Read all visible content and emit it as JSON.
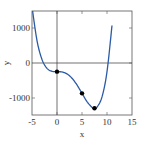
{
  "chart_data": {
    "type": "line",
    "title": "",
    "xlabel": "x",
    "ylabel": "y",
    "xlim": [
      -5,
      15
    ],
    "ylim": [
      -1500,
      1500
    ],
    "xticks": [
      -5,
      0,
      5,
      10,
      15
    ],
    "yticks": [
      -1000,
      0,
      1000
    ],
    "grid": false,
    "zero_lines": true,
    "series": [
      {
        "name": "f(x) = x^4 - 10x^3 - 250",
        "color": "#2b5aa6",
        "x": [
          -5,
          -4,
          -3,
          -2,
          -1,
          0,
          1,
          2,
          3,
          4,
          5,
          6,
          7,
          7.5,
          8,
          9,
          10,
          11
        ],
        "values": [
          1625,
          646,
          101,
          -154,
          -239,
          -250,
          -259,
          -314,
          -439,
          -634,
          -875,
          -1114,
          -1279,
          -1305,
          -1274,
          -979,
          -250,
          1081
        ]
      }
    ],
    "points": [
      {
        "x": 0,
        "y": -250
      },
      {
        "x": 5,
        "y": -875
      },
      {
        "x": 7.5,
        "y": -1305
      }
    ],
    "point_color": "#000000"
  },
  "labels": {
    "xlabel": "x",
    "ylabel": "y",
    "xticks": [
      "-5",
      "0",
      "5",
      "10",
      "15"
    ],
    "yticks": [
      "1000",
      "0",
      "-1000"
    ]
  }
}
